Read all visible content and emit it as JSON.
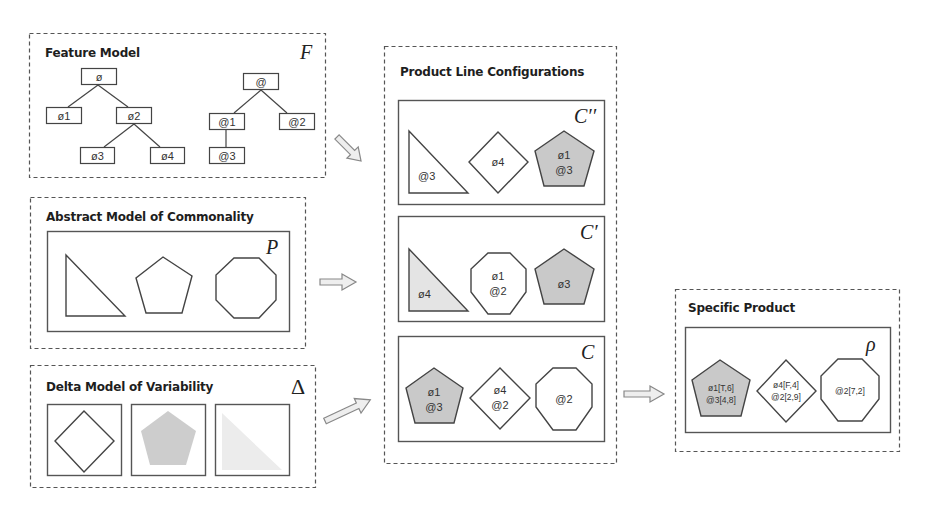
{
  "feature_model": {
    "title": "Feature Model",
    "symbol": "F",
    "tree_phi": {
      "root": "ø",
      "children": [
        "ø1",
        "ø2"
      ],
      "grandchildren": [
        "ø3",
        "ø4"
      ]
    },
    "tree_at": {
      "root": "@",
      "children": [
        "@1",
        "@2"
      ],
      "grandchildren": [
        "@3"
      ]
    }
  },
  "abstract_model": {
    "title": "Abstract Model of Commonality",
    "symbol": "P",
    "shapes": [
      "triangle",
      "pentagon",
      "octagon"
    ]
  },
  "delta_model": {
    "title": "Delta Model of Variability",
    "symbol": "Δ",
    "shapes": [
      "diamond-outline",
      "pentagon-gray",
      "triangle-light"
    ]
  },
  "product_line": {
    "title": "Product Line Configurations",
    "configs": [
      {
        "symbol": "C′′",
        "triangle": {
          "fill": "white",
          "line1": "@3"
        },
        "middle": {
          "shape": "diamond",
          "line1": "ø4"
        },
        "right": {
          "shape": "pentagon",
          "fill": "gray",
          "line1": "ø1",
          "line2": "@3"
        }
      },
      {
        "symbol": "C′",
        "triangle": {
          "fill": "light",
          "line1": "ø4"
        },
        "middle": {
          "shape": "octagon",
          "line1": "ø1",
          "line2": "@2"
        },
        "right": {
          "shape": "pentagon",
          "fill": "gray",
          "line1": "ø3"
        }
      },
      {
        "symbol": "C",
        "left": {
          "shape": "pentagon",
          "fill": "gray",
          "line1": "ø1",
          "line2": "@3"
        },
        "middle": {
          "shape": "diamond",
          "line1": "ø4",
          "line2": "@2"
        },
        "right": {
          "shape": "octagon",
          "line1": "@2"
        }
      }
    ]
  },
  "specific_product": {
    "title": "Specific Product",
    "symbol": "ρ",
    "pentagon": {
      "line1": "ø1[T,6]",
      "line2": "@3[4,8]"
    },
    "diamond": {
      "line1": "ø4[F,4]",
      "line2": "@2[2,9]"
    },
    "octagon": {
      "line1": "@2[7,2]"
    }
  },
  "colors": {
    "gray_fill": "#c9c9c9",
    "light_fill": "#e4e4e4",
    "stroke": "#444444",
    "arrow_fill": "#eeeeee"
  }
}
